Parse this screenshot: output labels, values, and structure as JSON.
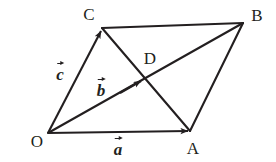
{
  "figure": {
    "kind": "vector-parallelogram-diagram",
    "width": 276,
    "height": 162,
    "background_color": "#ffffff",
    "stroke_color": "#231f20",
    "points": [
      {
        "id": "O",
        "label": "O",
        "x": 48,
        "y": 133,
        "label_x": 37,
        "label_y": 141
      },
      {
        "id": "A",
        "label": "A",
        "x": 190,
        "y": 131,
        "label_x": 193,
        "label_y": 148
      },
      {
        "id": "B",
        "label": "B",
        "x": 243,
        "y": 23,
        "label_x": 257,
        "label_y": 15
      },
      {
        "id": "C",
        "label": "C",
        "x": 102,
        "y": 28,
        "label_x": 89,
        "label_y": 14
      },
      {
        "id": "D",
        "label": "D",
        "x": 145,
        "y": 83,
        "label_x": 150,
        "label_y": 58
      }
    ],
    "segments": [
      {
        "id": "CB",
        "from": "C",
        "to": "B",
        "arrow": false
      },
      {
        "id": "AB",
        "from": "A",
        "to": "B",
        "arrow": false
      },
      {
        "id": "CA",
        "from": "C",
        "to": "A",
        "arrow": false
      }
    ],
    "vectors": [
      {
        "id": "a",
        "label": "a",
        "from": "O",
        "to": "A",
        "arrow": true,
        "label_x": 118,
        "label_y": 147
      },
      {
        "id": "b",
        "label": "b",
        "from": "O",
        "to": "B",
        "arrow": true,
        "arrow_at_x": 141,
        "arrow_at_y": 86,
        "label_x": 101,
        "label_y": 88
      },
      {
        "id": "c",
        "label": "c",
        "from": "O",
        "to": "C",
        "arrow": true,
        "label_x": 60,
        "label_y": 72
      }
    ]
  }
}
